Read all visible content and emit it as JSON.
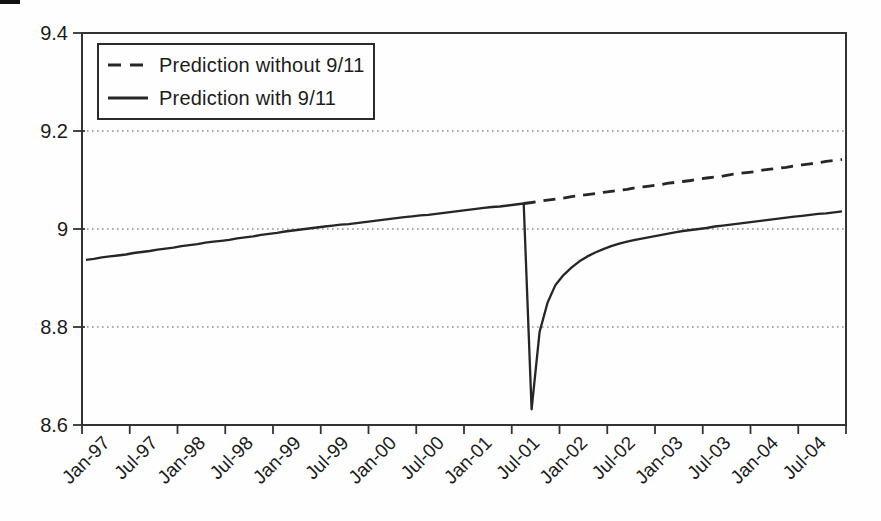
{
  "figure": {
    "background": "#fefefe",
    "line_color": "#262626",
    "grid_color": "#5a5a5a",
    "frame_color": "#333333"
  },
  "legend": {
    "items": [
      {
        "label": "Prediction without 9/11",
        "style": "dashed"
      },
      {
        "label": "Prediction with 9/11",
        "style": "solid"
      }
    ]
  },
  "chart_data": {
    "type": "line",
    "title": "",
    "xlabel": "",
    "ylabel": "",
    "ylim": [
      8.6,
      9.4
    ],
    "n_months": 96,
    "x_start_label": "Jan-97",
    "x_end_month": "Dec-04",
    "grid": "horizontal-dotted",
    "grid_values": [
      9.2,
      9.0,
      8.8
    ],
    "legend_position": "top-left",
    "y_ticks": [
      {
        "label": "9.4",
        "value": 9.4
      },
      {
        "label": "9.2",
        "value": 9.2
      },
      {
        "label": "9",
        "value": 9.0
      },
      {
        "label": "8.8",
        "value": 8.8
      },
      {
        "label": "8.6",
        "value": 8.6
      }
    ],
    "x_tick_labels": [
      "Jan-97",
      "Jul-97",
      "Jan-98",
      "Jul-98",
      "Jan-99",
      "Jul-99",
      "Jan-00",
      "Jul-00",
      "Jan-01",
      "Jul-01",
      "Jan-02",
      "Jul-02",
      "Jan-03",
      "Jul-03",
      "Jan-04",
      "Jul-04"
    ],
    "series": [
      {
        "name": "Prediction without 9/11",
        "style": "dashed",
        "x_start": 55,
        "values": [
          9.052,
          9.054,
          9.057,
          9.059,
          9.061,
          9.063,
          9.066,
          9.068,
          9.07,
          9.072,
          9.075,
          9.077,
          9.079,
          9.081,
          9.084,
          9.086,
          9.088,
          9.09,
          9.093,
          9.095,
          9.097,
          9.099,
          9.102,
          9.104,
          9.106,
          9.108,
          9.111,
          9.113,
          9.115,
          9.117,
          9.12,
          9.122,
          9.124,
          9.126,
          9.129,
          9.131,
          9.133,
          9.135,
          9.138,
          9.14,
          9.142
        ]
      },
      {
        "name": "Prediction with 9/11",
        "style": "solid",
        "x_start": 0,
        "values": [
          8.937,
          8.939,
          8.942,
          8.944,
          8.946,
          8.948,
          8.951,
          8.953,
          8.955,
          8.958,
          8.96,
          8.962,
          8.965,
          8.967,
          8.969,
          8.972,
          8.974,
          8.976,
          8.978,
          8.981,
          8.983,
          8.985,
          8.988,
          8.99,
          8.992,
          8.995,
          8.997,
          8.999,
          9.001,
          9.003,
          9.005,
          9.007,
          9.009,
          9.01,
          9.012,
          9.014,
          9.016,
          9.018,
          9.02,
          9.022,
          9.024,
          9.026,
          9.028,
          9.029,
          9.031,
          9.033,
          9.035,
          9.037,
          9.039,
          9.041,
          9.043,
          9.045,
          9.046,
          9.048,
          9.05,
          9.052,
          8.632,
          8.79,
          8.85,
          8.886,
          8.906,
          8.921,
          8.934,
          8.944,
          8.952,
          8.959,
          8.965,
          8.97,
          8.974,
          8.978,
          8.981,
          8.984,
          8.987,
          8.99,
          8.993,
          8.996,
          8.998,
          9.0,
          9.002,
          9.005,
          9.007,
          9.009,
          9.011,
          9.013,
          9.015,
          9.017,
          9.019,
          9.021,
          9.023,
          9.025,
          9.027,
          9.029,
          9.031,
          9.032,
          9.034,
          9.036
        ]
      }
    ]
  }
}
